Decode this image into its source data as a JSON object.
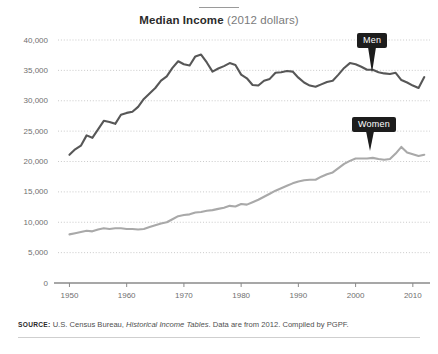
{
  "title": {
    "main": "Median Income",
    "sub": "(2012 dollars)"
  },
  "callouts": {
    "men": "Men",
    "women": "Women"
  },
  "source": {
    "label": "SOURCE:",
    "text_before_italic": " U.S. Census Bureau, ",
    "italic": "Historical Income Tables",
    "text_after_italic": ". Data are from 2012. Compiled by PGPF."
  },
  "colors": {
    "men": "#575757",
    "women": "#a9a9a9",
    "grid": "#bdbdbd",
    "axis": "#8a8a8a",
    "callout_bg": "#1d1d1d",
    "text": "#6f6f6f"
  },
  "chart_data": {
    "type": "line",
    "xlabel": "",
    "ylabel": "",
    "xlim": [
      1948,
      2013
    ],
    "ylim": [
      0,
      42000
    ],
    "grid": true,
    "legend": "inline-callouts",
    "ytick_labels": [
      "0",
      "5,000",
      "10,000",
      "15,000",
      "20,000",
      "25,000",
      "30,000",
      "35,000",
      "40,000"
    ],
    "ytick_values": [
      0,
      5000,
      10000,
      15000,
      20000,
      25000,
      30000,
      35000,
      40000
    ],
    "xtick_labels": [
      "1950",
      "1960",
      "1970",
      "1980",
      "1990",
      "2000",
      "2010"
    ],
    "xtick_values": [
      1950,
      1960,
      1970,
      1980,
      1990,
      2000,
      2010
    ],
    "x": [
      1950,
      1951,
      1952,
      1953,
      1954,
      1955,
      1956,
      1957,
      1958,
      1959,
      1960,
      1961,
      1962,
      1963,
      1964,
      1965,
      1966,
      1967,
      1968,
      1969,
      1970,
      1971,
      1972,
      1973,
      1974,
      1975,
      1976,
      1977,
      1978,
      1979,
      1980,
      1981,
      1982,
      1983,
      1984,
      1985,
      1986,
      1987,
      1988,
      1989,
      1990,
      1991,
      1992,
      1993,
      1994,
      1995,
      1996,
      1997,
      1998,
      1999,
      2000,
      2001,
      2002,
      2003,
      2004,
      2005,
      2006,
      2007,
      2008,
      2009,
      2010,
      2011,
      2012
    ],
    "series": [
      {
        "name": "Men",
        "color": "#575757",
        "values": [
          21100,
          22000,
          22600,
          24300,
          23900,
          25300,
          26700,
          26500,
          26200,
          27700,
          28000,
          28200,
          29000,
          30300,
          31200,
          32100,
          33300,
          34000,
          35400,
          36500,
          36000,
          35800,
          37300,
          37600,
          36300,
          34800,
          35300,
          35700,
          36200,
          35900,
          34300,
          33700,
          32600,
          32500,
          33300,
          33600,
          34600,
          34700,
          34900,
          34800,
          33800,
          33000,
          32500,
          32300,
          32700,
          33100,
          33300,
          34300,
          35400,
          36200,
          36000,
          35600,
          35100,
          35100,
          34700,
          34500,
          34400,
          34600,
          33400,
          33000,
          32500,
          32100,
          33900
        ]
      },
      {
        "name": "Women",
        "color": "#a9a9a9",
        "values": [
          8000,
          8200,
          8400,
          8600,
          8500,
          8800,
          9000,
          8900,
          9000,
          9000,
          8900,
          8900,
          8800,
          8900,
          9200,
          9500,
          9800,
          10000,
          10500,
          11000,
          11200,
          11300,
          11600,
          11700,
          11900,
          12000,
          12200,
          12400,
          12700,
          12600,
          13000,
          12900,
          13300,
          13700,
          14200,
          14700,
          15200,
          15600,
          16000,
          16400,
          16700,
          16900,
          17000,
          17000,
          17500,
          17900,
          18200,
          18900,
          19600,
          20100,
          20500,
          20500,
          20500,
          20600,
          20400,
          20300,
          20400,
          21300,
          22400,
          21500,
          21200,
          20900,
          21100
        ]
      }
    ]
  }
}
